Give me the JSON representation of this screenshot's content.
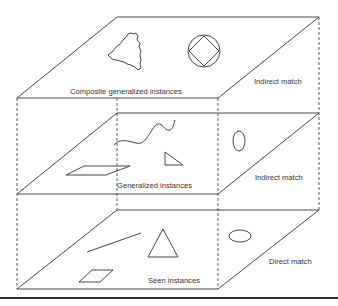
{
  "diagram": {
    "type": "layered-3d-box",
    "layers": [
      {
        "id": "top",
        "label": "Composite generalized instances",
        "match_label": "Indirect match",
        "shapes": [
          "irregular-blob",
          "circle-with-inscribed-square"
        ]
      },
      {
        "id": "middle",
        "label": "Generalized instances",
        "match_label": "Indirect match",
        "shapes": [
          "wavy-curve",
          "right-triangle",
          "parallelogram",
          "vertical-ellipse"
        ]
      },
      {
        "id": "bottom",
        "label": "Seen instances",
        "match_label": "Direct match",
        "shapes": [
          "line-segment",
          "triangle",
          "small-parallelogram",
          "horizontal-ellipse"
        ]
      }
    ],
    "colors": {
      "line": "#333333",
      "background": "#ffffff"
    },
    "caption_partial": ""
  }
}
